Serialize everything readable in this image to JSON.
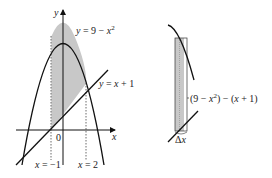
{
  "left_figure": {
    "y_axis_label": "y",
    "x_axis_label": "x",
    "origin_label": "0",
    "parabola_label": {
      "lhs": "y",
      "eq": " = 9 − ",
      "var": "x",
      "exp": "2"
    },
    "line_label": {
      "lhs": "y",
      "eq": " = ",
      "var": "x",
      "rest": " + 1"
    },
    "left_bound_label": {
      "var": "x",
      "rest": " = −1"
    },
    "right_bound_label": {
      "var": "x",
      "rest": " = 2"
    }
  },
  "right_figure": {
    "height_label": {
      "open": "(9 − ",
      "var": "x",
      "exp": "2",
      "mid": ") − (",
      "var2": "x",
      "rest": " + 1)"
    },
    "width_label": {
      "delta": "Δ",
      "var": "x"
    }
  },
  "colors": {
    "shade": "#c8c8c8",
    "stroke": "#111111",
    "background": "#ffffff"
  }
}
